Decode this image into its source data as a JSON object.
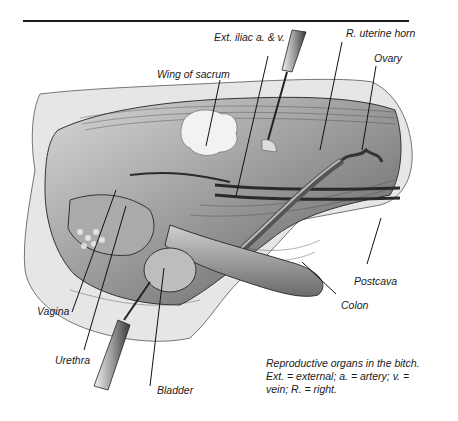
{
  "figure": {
    "labels": {
      "ext_iliac": "Ext. iliac a. & v.",
      "uterine_horn": "R. uterine horn",
      "ovary": "Ovary",
      "wing_sacrum": "Wing of sacrum",
      "postcava": "Postcava",
      "colon": "Colon",
      "vagina": "Vagina",
      "urethra": "Urethra",
      "bladder": "Bladder"
    },
    "caption": {
      "line1": "Reproductive organs in the bitch.",
      "line2": "Ext. = external; a. = artery; v. =",
      "line3": "vein; R. = right."
    },
    "colors": {
      "ink": "#1a1a1a",
      "tissue_dark": "#3c3c3c",
      "tissue_mid": "#8a8a8a",
      "tissue_light": "#c8c8c8",
      "background": "#ffffff"
    }
  }
}
